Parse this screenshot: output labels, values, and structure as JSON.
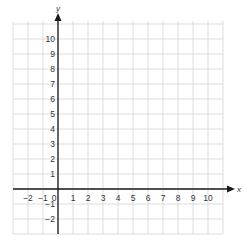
{
  "chart_data": {
    "type": "scatter",
    "title": "",
    "xlabel": "x",
    "ylabel": "y",
    "xlim": [
      -3,
      11
    ],
    "ylim": [
      -3,
      11
    ],
    "grid": true,
    "x_ticks": [
      -2,
      -1,
      0,
      1,
      2,
      3,
      4,
      5,
      6,
      7,
      8,
      9,
      10
    ],
    "y_ticks": [
      -2,
      -1,
      1,
      2,
      3,
      4,
      5,
      6,
      7,
      8,
      9,
      10
    ],
    "x_tick_labels": [
      "−2",
      "−1",
      "0",
      "1",
      "2",
      "3",
      "4",
      "5",
      "6",
      "7",
      "8",
      "9",
      "10"
    ],
    "y_tick_labels": [
      "−2",
      "−1",
      "1",
      "2",
      "3",
      "4",
      "5",
      "6",
      "7",
      "8",
      "9",
      "10"
    ],
    "series": []
  },
  "colors": {
    "grid": "#d4d4d4",
    "axis": "#1a1a1a",
    "text": "#333333"
  }
}
